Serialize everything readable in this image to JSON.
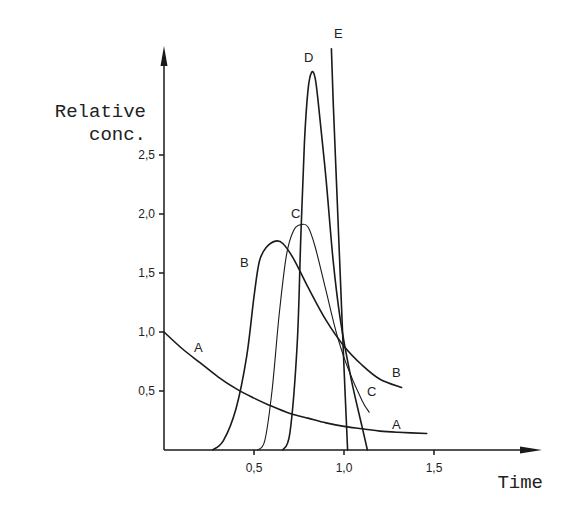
{
  "chart_data": {
    "type": "line",
    "title": "",
    "xlabel": "Time",
    "ylabel": "Relative conc.",
    "ylabel_lines": [
      "Relative",
      "conc."
    ],
    "xlim": [
      0,
      2.1
    ],
    "ylim": [
      0,
      3.4
    ],
    "grid": false,
    "legend": "inline curve labels",
    "x_ticks": [
      {
        "value": 0.5,
        "label": "0,5"
      },
      {
        "value": 1.0,
        "label": "1,0"
      },
      {
        "value": 1.5,
        "label": "1,5"
      }
    ],
    "y_ticks": [
      {
        "value": 0.5,
        "label": "0,5"
      },
      {
        "value": 1.0,
        "label": "1,0"
      },
      {
        "value": 1.5,
        "label": "1,5"
      },
      {
        "value": 2.0,
        "label": "2,0"
      },
      {
        "value": 2.5,
        "label": "2,5"
      }
    ],
    "series": [
      {
        "name": "A",
        "x": [
          0.0,
          0.1,
          0.2,
          0.3,
          0.4,
          0.5,
          0.6,
          0.7,
          0.8,
          0.9,
          1.0,
          1.1,
          1.2,
          1.3,
          1.46
        ],
        "y": [
          1.0,
          0.86,
          0.74,
          0.62,
          0.52,
          0.44,
          0.37,
          0.31,
          0.27,
          0.23,
          0.2,
          0.18,
          0.16,
          0.15,
          0.14
        ]
      },
      {
        "name": "B",
        "x": [
          0.27,
          0.33,
          0.4,
          0.46,
          0.5,
          0.53,
          0.57,
          0.62,
          0.66,
          0.72,
          0.8,
          0.9,
          1.0,
          1.1,
          1.2,
          1.32
        ],
        "y": [
          0.0,
          0.08,
          0.35,
          0.8,
          1.3,
          1.6,
          1.72,
          1.77,
          1.75,
          1.62,
          1.38,
          1.1,
          0.88,
          0.72,
          0.6,
          0.53
        ]
      },
      {
        "name": "C",
        "x": [
          0.52,
          0.56,
          0.6,
          0.64,
          0.68,
          0.72,
          0.76,
          0.8,
          0.84,
          0.9,
          0.96,
          1.02,
          1.1,
          1.14
        ],
        "y": [
          0.0,
          0.08,
          0.5,
          1.15,
          1.65,
          1.86,
          1.91,
          1.89,
          1.72,
          1.35,
          0.98,
          0.7,
          0.42,
          0.32
        ]
      },
      {
        "name": "D",
        "x": [
          0.66,
          0.7,
          0.74,
          0.76,
          0.78,
          0.8,
          0.82,
          0.84,
          0.86,
          0.9,
          0.94,
          0.98,
          1.04,
          1.1,
          1.13
        ],
        "y": [
          0.0,
          0.15,
          0.9,
          1.8,
          2.6,
          3.05,
          3.2,
          3.15,
          2.9,
          2.3,
          1.6,
          1.1,
          0.6,
          0.2,
          0.0
        ]
      },
      {
        "name": "E",
        "x": [
          1.02,
          1.0,
          0.98,
          0.96,
          0.94,
          0.93
        ],
        "y": [
          0.0,
          0.7,
          1.45,
          2.2,
          2.95,
          3.4
        ]
      }
    ],
    "annotations": [
      {
        "text": "A",
        "x": 0.19,
        "y": 0.87
      },
      {
        "text": "A",
        "x": 1.3,
        "y": 0.2
      },
      {
        "text": "B",
        "x": 0.47,
        "y": 1.67
      },
      {
        "text": "B",
        "x": 1.3,
        "y": 0.6
      },
      {
        "text": "C",
        "x": 0.72,
        "y": 1.97
      },
      {
        "text": "C",
        "x": 1.15,
        "y": 0.44
      },
      {
        "text": "D",
        "x": 0.8,
        "y": 3.34
      },
      {
        "text": "E",
        "x": 0.98,
        "y": 3.57
      }
    ]
  },
  "labels": {
    "ylabel_line1": "Relative",
    "ylabel_line2": "conc.",
    "xlabel": "Time",
    "x_tick_05": "0,5",
    "x_tick_10": "1,0",
    "x_tick_15": "1,5",
    "y_tick_05": "0,5",
    "y_tick_10": "1,0",
    "y_tick_15": "1,5",
    "y_tick_20": "2,0",
    "y_tick_25": "2,5",
    "curve_A": "A",
    "curve_B": "B",
    "curve_C": "C",
    "curve_D": "D",
    "curve_E": "E"
  }
}
